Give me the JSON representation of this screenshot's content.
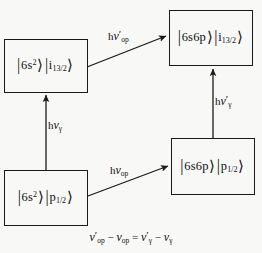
{
  "figure": {
    "type": "energy-level-transition-diagram",
    "background_color": "#f8f8f7",
    "line_color": "#1a1a1a"
  },
  "boxes": {
    "top_left": {
      "name": "state-6s2-i13-2",
      "ket1": "6s",
      "ket1_sup": "2",
      "ket2": "i",
      "ket2_sub": "13/2",
      "text": "|6s²⟩|i13/2⟩"
    },
    "top_right": {
      "name": "state-6s6p-i13-2",
      "ket1": "6s6p",
      "ket1_sup": "",
      "ket2": "i",
      "ket2_sub": "13/2",
      "text": "|6s6p⟩|i13/2⟩"
    },
    "bottom_left": {
      "name": "state-6s2-p1-2",
      "ket1": "6s",
      "ket1_sup": "2",
      "ket2": "p",
      "ket2_sub": "1/2",
      "text": "|6s²⟩|p1/2⟩"
    },
    "bottom_right": {
      "name": "state-6s6p-p1-2",
      "ket1": "6s6p",
      "ket1_sup": "",
      "ket2": "p",
      "ket2_sub": "1/2",
      "text": "|6s6p⟩|p1/2⟩"
    }
  },
  "arrows": {
    "top_diagonal": {
      "h": "h",
      "nu": "ν",
      "prime": "′",
      "sub": "op",
      "text": "hν′op",
      "from": "top_left",
      "to": "top_right"
    },
    "left_vertical": {
      "h": "h",
      "nu": "ν",
      "prime": "",
      "sub": "γ",
      "text": "hνγ",
      "from": "bottom_left",
      "to": "top_left"
    },
    "bottom_diagonal": {
      "h": "h",
      "nu": "ν",
      "prime": "",
      "sub": "op",
      "text": "hνop",
      "from": "bottom_left",
      "to": "bottom_right"
    },
    "right_vertical": {
      "h": "h",
      "nu": "ν",
      "prime": "′",
      "sub": "γ",
      "text": "hν′γ",
      "from": "bottom_right",
      "to": "top_right"
    }
  },
  "equation": {
    "nu": "ν",
    "prime": "′",
    "sub_op": "op",
    "sub_gamma": "γ",
    "minus": "−",
    "equals": "=",
    "text": "ν′op − νop = ν′γ − νγ"
  }
}
